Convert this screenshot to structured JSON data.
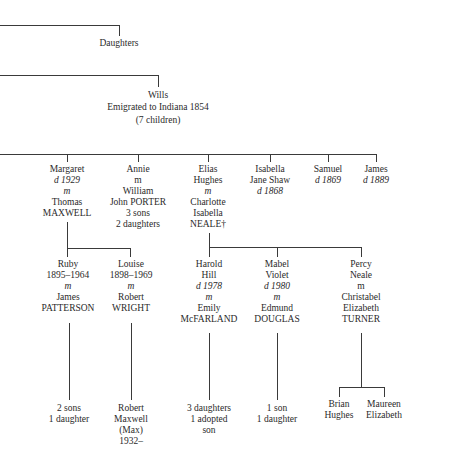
{
  "generation1": {
    "daughters": {
      "line1": "Daughters"
    },
    "wills": {
      "line1": "Wills",
      "line2": "Emigrated to Indiana 1854",
      "line3": "(7 children)"
    }
  },
  "generation2": [
    {
      "id": "margaret",
      "lines": [
        "Margaret",
        "d 1929",
        "m",
        "Thomas",
        "MAXWELL"
      ]
    },
    {
      "id": "annie",
      "lines": [
        "Annie",
        "m",
        "William",
        "John PORTER",
        "3 sons",
        "2 daughters"
      ]
    },
    {
      "id": "elias",
      "lines": [
        "Elias",
        "Hughes",
        "m",
        "Charlotte",
        "Isabella",
        "NEALE†"
      ]
    },
    {
      "id": "isabella",
      "lines": [
        "Isabella",
        "Jane Shaw",
        "d 1868"
      ]
    },
    {
      "id": "samuel",
      "lines": [
        "Samuel",
        "d 1869"
      ]
    },
    {
      "id": "james",
      "lines": [
        "James",
        "d 1889"
      ]
    }
  ],
  "generation3": [
    {
      "id": "ruby",
      "lines": [
        "Ruby",
        "1895–1964",
        "m",
        "James",
        "PATTERSON"
      ]
    },
    {
      "id": "louise",
      "lines": [
        "Louise",
        "1898–1969",
        "m",
        "Robert",
        "WRIGHT"
      ]
    },
    {
      "id": "harold",
      "lines": [
        "Harold",
        "Hill",
        "d 1978",
        "m",
        "Emily",
        "McFARLAND"
      ]
    },
    {
      "id": "mabel",
      "lines": [
        "Mabel",
        "Violet",
        "d 1980",
        "m",
        "Edmund",
        "DOUGLAS"
      ]
    },
    {
      "id": "percy",
      "lines": [
        "Percy",
        "Neale",
        "m",
        "Christabel",
        "Elizabeth",
        "TURNER"
      ]
    }
  ],
  "generation4": [
    {
      "id": "ruby-children",
      "lines": [
        "2 sons",
        "1 daughter"
      ]
    },
    {
      "id": "robert-maxwell",
      "lines": [
        "Robert",
        "Maxwell",
        "(Max)",
        "1932–"
      ]
    },
    {
      "id": "harold-children",
      "lines": [
        "3 daughters",
        "1 adopted",
        "son"
      ]
    },
    {
      "id": "mabel-children",
      "lines": [
        "1 son",
        "1 daughter"
      ]
    },
    {
      "id": "brian",
      "lines": [
        "Brian",
        "Hughes"
      ]
    },
    {
      "id": "maureen",
      "lines": [
        "Maureen",
        "Elizabeth"
      ]
    }
  ]
}
